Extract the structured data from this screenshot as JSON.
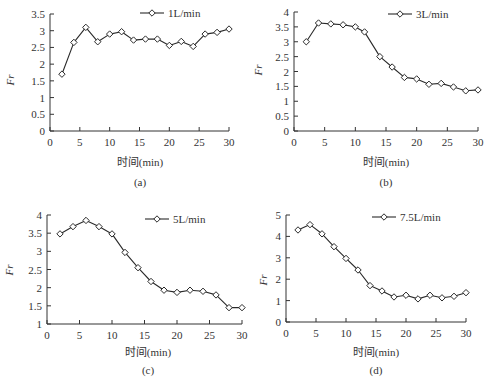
{
  "figure": {
    "background": "#ffffff",
    "line_color": "#2a2a2a",
    "axis_color": "#333333"
  },
  "chart_data": [
    {
      "id": "a",
      "type": "line",
      "panel_label": "(a)",
      "title": "",
      "xlabel": "时间(min)",
      "ylabel": "Fr",
      "xlim": [
        0,
        30
      ],
      "ylim": [
        0,
        3.5
      ],
      "xticks": [
        0,
        5,
        10,
        15,
        20,
        25,
        30
      ],
      "yticks": [
        0,
        0.5,
        1,
        1.5,
        2,
        2.5,
        3,
        3.5
      ],
      "ytick_labels": [
        "0",
        "0.5",
        "1",
        "1.5",
        "2",
        "2.5",
        "3",
        "3.5"
      ],
      "grid": false,
      "legend_position": "top-right",
      "series": [
        {
          "name": "1L/min",
          "marker": "diamond",
          "x": [
            2,
            4,
            6,
            8,
            10,
            12,
            14,
            16,
            18,
            20,
            22,
            24,
            26,
            28,
            30
          ],
          "values": [
            1.7,
            2.65,
            3.1,
            2.67,
            2.9,
            2.97,
            2.72,
            2.75,
            2.75,
            2.56,
            2.68,
            2.53,
            2.9,
            2.95,
            3.05
          ]
        }
      ],
      "layout": {
        "x0": 50,
        "x1": 229,
        "ytop": 14,
        "ybot": 131,
        "legend_x": 140,
        "legend_y": 13,
        "xlabel_x": 140,
        "xlabel_y": 166,
        "panel_y": 186,
        "ylabel_x": 14,
        "ylabel_y": 80
      }
    },
    {
      "id": "b",
      "type": "line",
      "panel_label": "(b)",
      "title": "",
      "xlabel": "时间(min)",
      "ylabel": "Fr",
      "xlim": [
        0,
        30
      ],
      "ylim": [
        0,
        4
      ],
      "xticks": [
        0,
        5,
        10,
        15,
        20,
        25,
        30
      ],
      "yticks": [
        0,
        0.5,
        1,
        1.5,
        2,
        2.5,
        3,
        3.5,
        4
      ],
      "ytick_labels": [
        "0",
        "0.5",
        "1",
        "1.5",
        "2",
        "2.5",
        "3",
        "3.5",
        "4"
      ],
      "grid": false,
      "legend_position": "top-right",
      "series": [
        {
          "name": "3L/min",
          "marker": "diamond",
          "x": [
            2,
            4,
            6,
            8,
            10,
            11.5,
            14,
            16,
            18,
            20,
            22,
            24,
            26,
            28,
            30
          ],
          "values": [
            3.0,
            3.63,
            3.6,
            3.57,
            3.5,
            3.33,
            2.5,
            2.15,
            1.8,
            1.75,
            1.57,
            1.6,
            1.48,
            1.35,
            1.38
          ]
        }
      ],
      "layout": {
        "x0": 294,
        "x1": 478,
        "ytop": 12,
        "ybot": 131,
        "legend_x": 388,
        "legend_y": 14,
        "xlabel_x": 386,
        "xlabel_y": 166,
        "panel_y": 186,
        "ylabel_x": 262,
        "ylabel_y": 70
      }
    },
    {
      "id": "c",
      "type": "line",
      "panel_label": "(c)",
      "title": "",
      "xlabel": "时间(min)",
      "ylabel": "Fr",
      "xlim": [
        0,
        30
      ],
      "ylim": [
        1,
        4
      ],
      "xticks": [
        0,
        5,
        10,
        15,
        20,
        25,
        30
      ],
      "yticks": [
        1,
        1.5,
        2,
        2.5,
        3,
        3.5,
        4
      ],
      "ytick_labels": [
        "1",
        "1.5",
        "2",
        "2.5",
        "3",
        "3.5",
        "4"
      ],
      "grid": false,
      "legend_position": "top-right",
      "series": [
        {
          "name": "5L/min",
          "marker": "diamond",
          "x": [
            2,
            4,
            6,
            8,
            10,
            12,
            14,
            16,
            18,
            20,
            22,
            24,
            26,
            28,
            30
          ],
          "values": [
            3.48,
            3.68,
            3.85,
            3.68,
            3.48,
            2.97,
            2.55,
            2.17,
            1.93,
            1.87,
            1.93,
            1.9,
            1.8,
            1.45,
            1.45
          ]
        }
      ],
      "layout": {
        "x0": 47,
        "x1": 242,
        "ytop": 215,
        "ybot": 324,
        "legend_x": 145,
        "legend_y": 219,
        "xlabel_x": 148,
        "xlabel_y": 356,
        "panel_y": 374,
        "ylabel_x": 13,
        "ylabel_y": 270
      }
    },
    {
      "id": "d",
      "type": "line",
      "panel_label": "(d)",
      "title": "",
      "xlabel": "时间(min)",
      "ylabel": "Fr",
      "xlim": [
        0,
        30
      ],
      "ylim": [
        0,
        5
      ],
      "xticks": [
        0,
        5,
        10,
        15,
        20,
        25,
        30
      ],
      "yticks": [
        0,
        1,
        2,
        3,
        4,
        5
      ],
      "ytick_labels": [
        "0",
        "1",
        "2",
        "3",
        "4",
        "5"
      ],
      "grid": false,
      "legend_position": "top-right",
      "series": [
        {
          "name": "7.5L/min",
          "marker": "diamond",
          "x": [
            2,
            4,
            6,
            8,
            10,
            12,
            14,
            16,
            18,
            20,
            22,
            24,
            26,
            28,
            30
          ],
          "values": [
            4.3,
            4.55,
            4.12,
            3.52,
            2.97,
            2.43,
            1.7,
            1.45,
            1.17,
            1.25,
            1.08,
            1.25,
            1.13,
            1.2,
            1.37
          ]
        }
      ],
      "layout": {
        "x0": 286,
        "x1": 466,
        "ytop": 215,
        "ybot": 322,
        "legend_x": 372,
        "legend_y": 217,
        "xlabel_x": 376,
        "xlabel_y": 356,
        "panel_y": 374,
        "ylabel_x": 267,
        "ylabel_y": 280
      }
    }
  ]
}
